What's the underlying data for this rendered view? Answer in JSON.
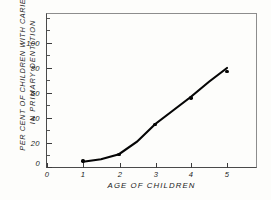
{
  "chart_data": {
    "type": "scatter",
    "title": "",
    "xlabel": "AGE OF CHILDREN",
    "ylabel_line1": "PER CENT OF CHILDREN WITH CARIES",
    "ylabel_line2": "IN PRIMARY DENTITION",
    "x": [
      1,
      2,
      3,
      4,
      5
    ],
    "values": [
      5.5,
      11,
      35,
      56,
      77
    ],
    "series": [
      {
        "name": "Per cent of children with caries in primary dentition",
        "x": [
          1,
          2,
          3,
          4,
          5
        ],
        "values": [
          5.5,
          11,
          35,
          56,
          77
        ]
      }
    ],
    "fitted_curve": {
      "description": "smooth increasing fitted curve through the points",
      "x": [
        1,
        1.5,
        2,
        2.5,
        3,
        3.5,
        4,
        4.5,
        5
      ],
      "values": [
        5,
        7,
        11,
        21,
        35,
        46,
        57,
        69,
        80
      ]
    },
    "xlim": [
      0,
      5.85
    ],
    "ylim": [
      0,
      124
    ],
    "xticks": [
      0,
      1,
      2,
      3,
      4,
      5
    ],
    "yticks": [
      0,
      20,
      40,
      60,
      80,
      100
    ],
    "y_minor_ticks": [
      10,
      30,
      50,
      70,
      90,
      110,
      120
    ],
    "grid": false,
    "legend": "none",
    "line_color": "#050505",
    "marker_color": "#050505",
    "axis_color": "#3b3b3b",
    "background_color": "#fdfdfb"
  },
  "axes": {
    "x_tick_labels": [
      "0",
      "1",
      "2",
      "3",
      "4",
      "5"
    ],
    "y_tick_labels": [
      "0",
      "20",
      "40",
      "60",
      "80",
      "100"
    ]
  }
}
